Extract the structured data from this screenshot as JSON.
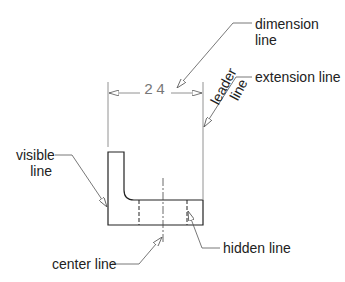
{
  "diagram": {
    "dimension_value": "24",
    "labels": {
      "dimension_line": {
        "line1": "dimension",
        "line2": "line"
      },
      "extension_line": "extension line",
      "leader_line": {
        "line1": "leader",
        "line2": "line"
      },
      "visible_line": {
        "line1": "visible",
        "line2": "line"
      },
      "hidden_line": "hidden line",
      "center_line": "center line"
    },
    "colors": {
      "stroke": "#222222",
      "dim_stroke": "#777777",
      "text": "#222222"
    }
  }
}
